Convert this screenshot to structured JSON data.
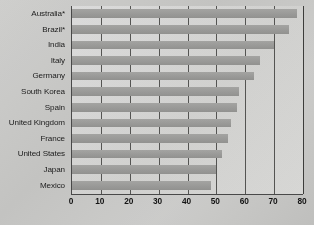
{
  "chart_data": {
    "type": "bar",
    "orientation": "horizontal",
    "title": "",
    "xlabel": "",
    "ylabel": "",
    "xlim": [
      0,
      80
    ],
    "xticks": [
      0,
      10,
      20,
      30,
      40,
      50,
      60,
      70,
      80
    ],
    "grid": true,
    "grid_axis": "x",
    "legend": null,
    "categories": [
      "Australia*",
      "Brazil*",
      "India",
      "Italy",
      "Germany",
      "South Korea",
      "Spain",
      "United Kingdom",
      "France",
      "United States",
      "Japan",
      "Mexico"
    ],
    "values": [
      78,
      75,
      70,
      65,
      63,
      58,
      57,
      55,
      54,
      52,
      50,
      48
    ],
    "bar_color": "#9d9d9b",
    "plot_background": "#d8d8d6",
    "figure_background": "#c9c9c7",
    "axis_color": "#4a4a4a"
  }
}
